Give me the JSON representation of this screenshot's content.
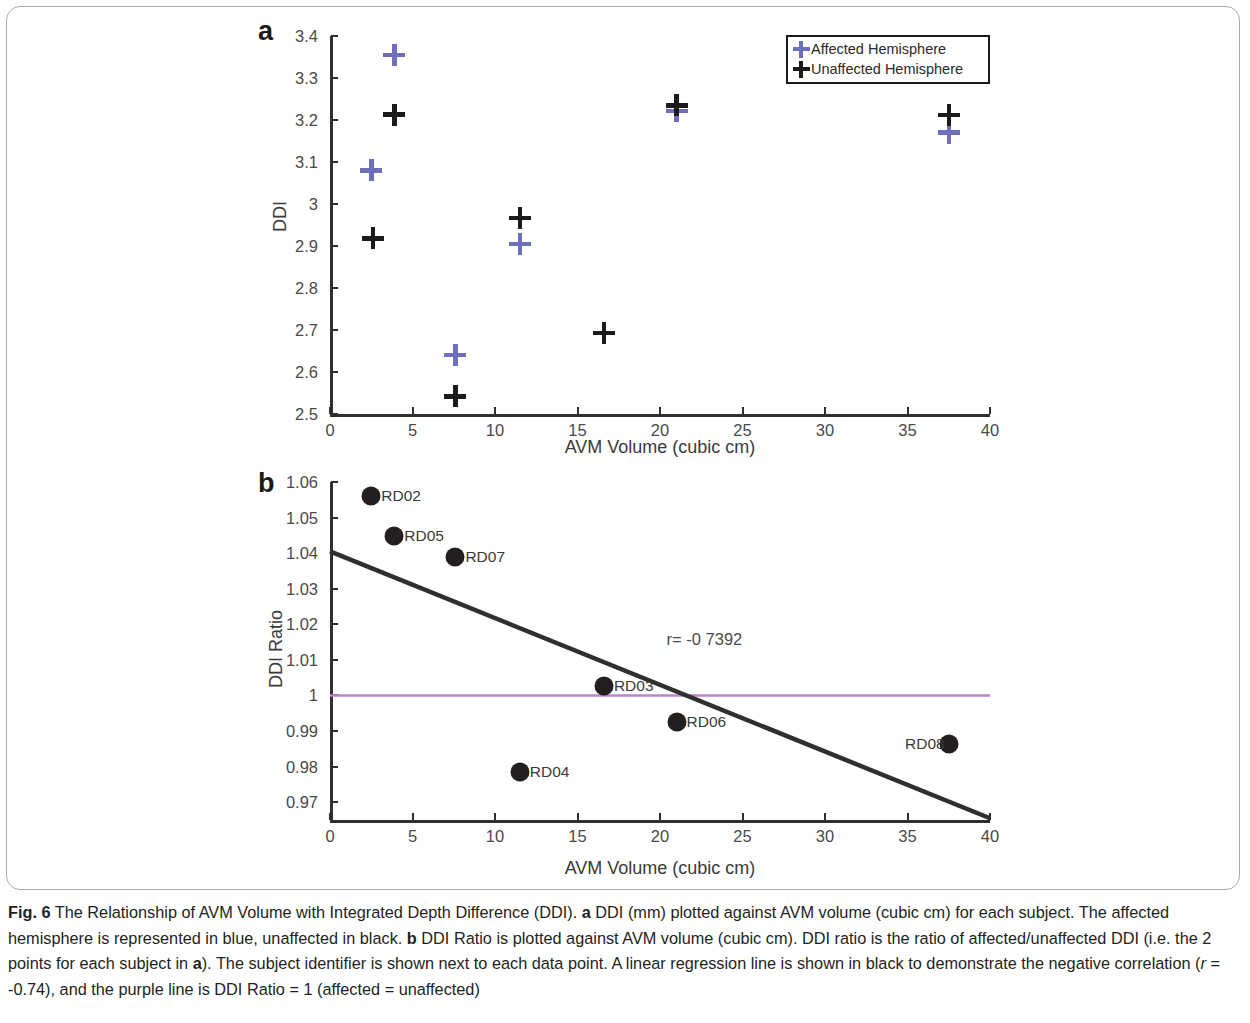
{
  "figure": {
    "label": "Fig. 6",
    "caption_segments": [
      {
        "text": "Fig. 6",
        "style": "bold"
      },
      {
        "text": " The Relationship of AVM Volume with Integrated Depth Difference (DDI). ",
        "style": "normal"
      },
      {
        "text": "a",
        "style": "bold"
      },
      {
        "text": " DDI (mm) plotted against AVM volume (cubic cm) for each subject. The affected hemisphere is represented in blue, unaffected in black. ",
        "style": "normal"
      },
      {
        "text": "b",
        "style": "bold"
      },
      {
        "text": " DDI Ratio is plotted against AVM volume (cubic cm). DDI ratio is the ratio of affected/unaffected DDI (i.e. the 2 points for each subject in ",
        "style": "normal"
      },
      {
        "text": "a",
        "style": "bold"
      },
      {
        "text": "). The subject identifier is shown next to each data point. A linear regression line is shown in black to demonstrate the negative correlation (",
        "style": "normal"
      },
      {
        "text": "r",
        "style": "italic"
      },
      {
        "text": " = -0.74), and the purple line is DDI Ratio = 1 (affected = unaffected)",
        "style": "normal"
      }
    ],
    "caption_plain": "Fig. 6 The Relationship of AVM Volume with Integrated Depth Difference (DDI). a DDI (mm) plotted against AVM volume (cubic cm) for each subject. The affected hemisphere is represented in blue, unaffected in black. b DDI Ratio is plotted against AVM volume (cubic cm). DDI ratio is the ratio of affected/unaffected DDI (i.e. the 2 points for each subject in a). The subject identifier is shown next to each data point. A linear regression line is shown in black to demonstrate the negative correlation (r = -0.74), and the purple line is DDI Ratio = 1 (affected = unaffected)"
  },
  "colors": {
    "affected_purple": "#6f6fbe",
    "unaffected_black": "#1b1b1b",
    "reference_line_purple": "#b munched",
    "refline": "#bb84cc",
    "axis": "#2f2f2f",
    "tick_text": "#4a4a4a"
  },
  "chart_data": [
    {
      "panel": "a",
      "type": "scatter",
      "title": "",
      "xlabel": "AVM Volume (cubic cm)",
      "ylabel": "DDI",
      "xlim": [
        0,
        40
      ],
      "ylim": [
        2.5,
        3.4
      ],
      "xticks": [
        0,
        5,
        10,
        15,
        20,
        25,
        30,
        35,
        40
      ],
      "yticks": [
        2.5,
        2.6,
        2.7,
        2.8,
        2.9,
        3.0,
        3.1,
        3.2,
        3.3,
        3.4
      ],
      "xtick_labels": [
        "0",
        "5",
        "10",
        "15",
        "20",
        "25",
        "30",
        "35",
        "40"
      ],
      "ytick_labels": [
        "2.5",
        "2.6",
        "2.7",
        "2.8",
        "2.9",
        "3",
        "3.1",
        "3.2",
        "3.3",
        "3.4"
      ],
      "grid": false,
      "legend_position": "top-right",
      "series": [
        {
          "name": "Affected Hemisphere",
          "marker": "plus",
          "color": "#6f6fbe",
          "points": [
            {
              "x": 2.5,
              "y": 3.08
            },
            {
              "x": 3.9,
              "y": 3.355
            },
            {
              "x": 7.6,
              "y": 2.64
            },
            {
              "x": 11.5,
              "y": 2.905
            },
            {
              "x": 16.6,
              "y": 2.693
            },
            {
              "x": 21.0,
              "y": 3.221
            },
            {
              "x": 37.5,
              "y": 3.17
            }
          ]
        },
        {
          "name": "Unaffected Hemisphere",
          "marker": "plus",
          "color": "#1b1b1b",
          "points": [
            {
              "x": 2.6,
              "y": 2.918
            },
            {
              "x": 3.9,
              "y": 3.213
            },
            {
              "x": 7.6,
              "y": 2.542
            },
            {
              "x": 11.5,
              "y": 2.967
            },
            {
              "x": 16.6,
              "y": 2.693
            },
            {
              "x": 21.0,
              "y": 3.235
            },
            {
              "x": 37.5,
              "y": 3.212
            }
          ]
        }
      ]
    },
    {
      "panel": "b",
      "type": "scatter",
      "title": "",
      "xlabel": "AVM Volume (cubic cm)",
      "ylabel": "DDI Ratio",
      "xlim": [
        0,
        40
      ],
      "ylim": [
        0.965,
        1.06
      ],
      "xticks": [
        0,
        5,
        10,
        15,
        20,
        25,
        30,
        35,
        40
      ],
      "yticks": [
        0.97,
        0.98,
        0.99,
        1.0,
        1.01,
        1.02,
        1.03,
        1.04,
        1.05,
        1.06
      ],
      "xtick_labels": [
        "0",
        "5",
        "10",
        "15",
        "20",
        "25",
        "30",
        "35",
        "40"
      ],
      "ytick_labels": [
        "0.97",
        "0.98",
        "0.99",
        "1",
        "1.01",
        "1.02",
        "1.03",
        "1.04",
        "1.05",
        "1.06"
      ],
      "grid": false,
      "annotation": "r= -0 7392",
      "annotation_value": -0.7392,
      "points": [
        {
          "label": "RD02",
          "x": 2.5,
          "y": 1.056,
          "label_side": "right"
        },
        {
          "label": "RD05",
          "x": 3.9,
          "y": 1.0447,
          "label_side": "right"
        },
        {
          "label": "RD07",
          "x": 7.6,
          "y": 1.039,
          "label_side": "right"
        },
        {
          "label": "RD03",
          "x": 16.6,
          "y": 1.0026,
          "label_side": "right"
        },
        {
          "label": "RD06",
          "x": 21.0,
          "y": 0.9925,
          "label_side": "right"
        },
        {
          "label": "RD04",
          "x": 11.5,
          "y": 0.9785,
          "label_side": "right"
        },
        {
          "label": "RD08",
          "x": 37.5,
          "y": 0.9863,
          "label_side": "left"
        }
      ],
      "regression_line": {
        "color": "#2f2f2f",
        "x0": 0,
        "y0": 1.0405,
        "x1": 40,
        "y1": 0.9655
      },
      "reference_line": {
        "color": "#bb84cc",
        "y": 1.0,
        "x0": 0,
        "x1": 40,
        "description": "DDI Ratio = 1"
      }
    }
  ],
  "panel_a": {
    "letter": "a",
    "legend": {
      "items": [
        {
          "label": "Affected Hemisphere",
          "color": "#6f6fbe"
        },
        {
          "label": "Unaffected Hemisphere",
          "color": "#1b1b1b"
        }
      ]
    }
  },
  "panel_b": {
    "letter": "b"
  }
}
